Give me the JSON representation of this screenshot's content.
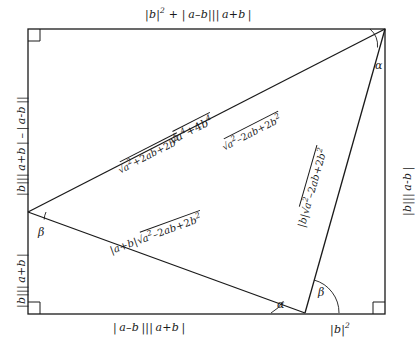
{
  "figure": {
    "type": "geometric-diagram"
  },
  "outer": {
    "top": "|b|² + | a–b|| a+b |",
    "left_upper": "|b||| a+b | – | a–b |||",
    "left_lower": "|b|| a+b |",
    "right": "|b|| a–b |",
    "bottom_left": "| a–b || a+b |",
    "bottom_right": "|b|²"
  },
  "interior": {
    "hypotenuse": "√(a⁴+4b⁴)",
    "hyp_seg_left": "√(a²+2ab+2b²)",
    "hyp_seg_right": "√(a²–2ab+2b²)",
    "lower_left_side": "|a+b|√(a²–2ab+2b²)",
    "right_side": "|b|√(a²–2ab+2b²)"
  },
  "angles": {
    "alpha_top_right": "α",
    "beta_left": "β",
    "alpha_bottom": "α",
    "beta_bottom": "β"
  },
  "colors": {
    "stroke": "#1a1a1a",
    "background": "#ffffff"
  }
}
